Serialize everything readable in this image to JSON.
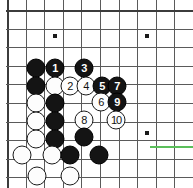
{
  "board": {
    "type": "go-board-diagram",
    "grid": {
      "spacing": 18.6,
      "origin_x": 7,
      "origin_y": 10,
      "columns": 11,
      "rows": 10,
      "line_color": "#5a5a5a",
      "edge_color": "#3c3c3c",
      "background": "#ffffff"
    },
    "hoshi_points": [
      {
        "x": 55,
        "y": 36
      },
      {
        "x": 147,
        "y": 36
      },
      {
        "x": 147,
        "y": 133
      }
    ],
    "marker": {
      "name": "green-highlight-line",
      "color": "#5bbf5b",
      "x": 150,
      "y": 146,
      "width": 43
    },
    "stones": [
      {
        "color": "black",
        "label": "",
        "x": 36,
        "y": 68
      },
      {
        "color": "black",
        "label": "1",
        "x": 55,
        "y": 68
      },
      {
        "color": "black",
        "label": "3",
        "x": 84,
        "y": 68
      },
      {
        "color": "black",
        "label": "",
        "x": 36,
        "y": 86
      },
      {
        "color": "white",
        "label": "",
        "x": 55,
        "y": 86
      },
      {
        "color": "white",
        "label": "2",
        "x": 70,
        "y": 86
      },
      {
        "color": "white",
        "label": "4",
        "x": 86,
        "y": 86
      },
      {
        "color": "black",
        "label": "5",
        "x": 102,
        "y": 86
      },
      {
        "color": "black",
        "label": "7",
        "x": 117,
        "y": 86
      },
      {
        "color": "white",
        "label": "",
        "x": 36,
        "y": 103
      },
      {
        "color": "black",
        "label": "",
        "x": 55,
        "y": 103
      },
      {
        "color": "white",
        "label": "6",
        "x": 101,
        "y": 102
      },
      {
        "color": "black",
        "label": "9",
        "x": 117,
        "y": 102
      },
      {
        "color": "white",
        "label": "",
        "x": 36,
        "y": 121
      },
      {
        "color": "black",
        "label": "",
        "x": 55,
        "y": 121
      },
      {
        "color": "white",
        "label": "8",
        "x": 84,
        "y": 120
      },
      {
        "color": "white",
        "label": "10",
        "x": 116,
        "y": 120
      },
      {
        "color": "white",
        "label": "",
        "x": 36,
        "y": 139
      },
      {
        "color": "black",
        "label": "",
        "x": 55,
        "y": 139
      },
      {
        "color": "black",
        "label": "",
        "x": 84,
        "y": 137
      },
      {
        "color": "white",
        "label": "",
        "x": 22,
        "y": 155
      },
      {
        "color": "white",
        "label": "",
        "x": 52,
        "y": 155
      },
      {
        "color": "black",
        "label": "",
        "x": 70,
        "y": 155
      },
      {
        "color": "black",
        "label": "",
        "x": 99,
        "y": 155
      },
      {
        "color": "white",
        "label": "",
        "x": 37,
        "y": 176
      },
      {
        "color": "white",
        "label": "",
        "x": 70,
        "y": 176
      }
    ]
  }
}
